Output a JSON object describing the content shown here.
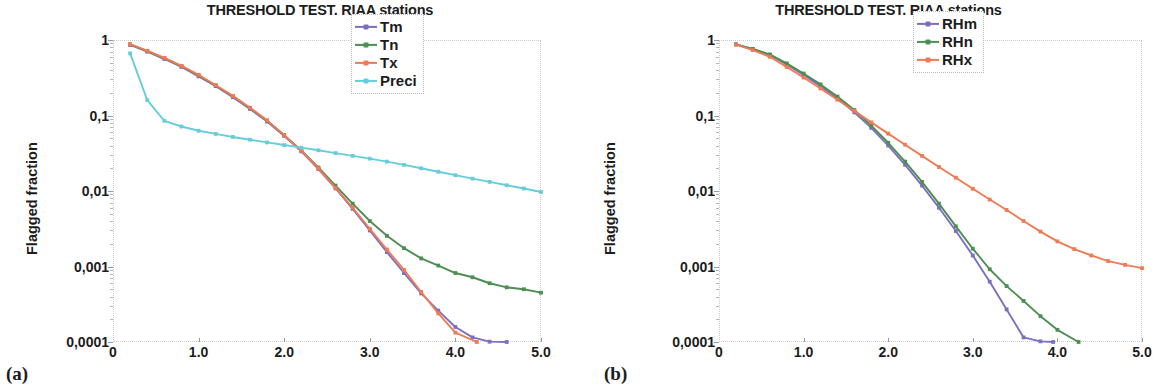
{
  "panels": [
    {
      "tag": "(a)",
      "title": "THRESHOLD TEST. RIAA stations",
      "xlabel": "Factor f",
      "ylabel": "Flagged fraction",
      "legend": [
        {
          "label": "Tm",
          "color": "#7d6fc0"
        },
        {
          "label": "Tn",
          "color": "#4d8f52"
        },
        {
          "label": "Tx",
          "color": "#ef7a55"
        },
        {
          "label": "Preci",
          "color": "#67cddb"
        }
      ]
    },
    {
      "tag": "(b)",
      "title": "THRESHOLD TEST. RIAA stations",
      "xlabel": "Factor f",
      "ylabel": "Flagged fraction",
      "legend": [
        {
          "label": "RHm",
          "color": "#7d6fc0"
        },
        {
          "label": "RHn",
          "color": "#4d8f52"
        },
        {
          "label": "RHx",
          "color": "#ef7a55"
        }
      ]
    }
  ],
  "axes": {
    "xticks": [
      "0",
      "1.0",
      "2.0",
      "3.0",
      "4.0",
      "5.0"
    ],
    "xtick_values": [
      0,
      1,
      2,
      3,
      4,
      5
    ],
    "yticks": [
      "1",
      "0,1",
      "0,01",
      "0,001",
      "0,0001"
    ],
    "ytick_values": [
      1,
      0.1,
      0.01,
      0.001,
      0.0001
    ]
  },
  "chart_data": [
    {
      "type": "line",
      "title": "THRESHOLD TEST. RIAA stations",
      "xlabel": "Factor f",
      "ylabel": "Flagged fraction",
      "yscale": "log",
      "xscale": "linear",
      "xlim": [
        0,
        5.0
      ],
      "ylim": [
        0.0001,
        1
      ],
      "grid": false,
      "legend_position": "top-right",
      "panel": "(a)",
      "series": [
        {
          "name": "Tm",
          "color": "#7d6fc0",
          "x": [
            0.2,
            0.4,
            0.6,
            0.8,
            1.0,
            1.2,
            1.4,
            1.6,
            1.8,
            2.0,
            2.2,
            2.4,
            2.6,
            2.8,
            3.0,
            3.2,
            3.4,
            3.6,
            3.8,
            4.0,
            4.2,
            4.4,
            4.6
          ],
          "y": [
            0.86,
            0.7,
            0.56,
            0.44,
            0.33,
            0.245,
            0.175,
            0.122,
            0.083,
            0.0535,
            0.0335,
            0.0195,
            0.0108,
            0.0058,
            0.003,
            0.00155,
            0.00082,
            0.00044,
            0.00026,
            0.000158,
            0.000115,
            0.000101,
            0.0001
          ]
        },
        {
          "name": "Tn",
          "color": "#4d8f52",
          "x": [
            0.2,
            0.4,
            0.6,
            0.8,
            1.0,
            1.2,
            1.4,
            1.6,
            1.8,
            2.0,
            2.2,
            2.4,
            2.6,
            2.8,
            3.0,
            3.2,
            3.4,
            3.6,
            3.8,
            4.0,
            4.2,
            4.4,
            4.6,
            4.8,
            5.0
          ],
          "y": [
            0.875,
            0.715,
            0.575,
            0.45,
            0.34,
            0.25,
            0.18,
            0.126,
            0.0855,
            0.055,
            0.0345,
            0.0205,
            0.0118,
            0.0068,
            0.004,
            0.00255,
            0.00175,
            0.00128,
            0.00103,
            0.00082,
            0.00072,
            0.0006,
            0.00053,
            0.0005,
            0.00045
          ]
        },
        {
          "name": "Tx",
          "color": "#ef7a55",
          "x": [
            0.2,
            0.4,
            0.6,
            0.8,
            1.0,
            1.2,
            1.4,
            1.6,
            1.8,
            2.0,
            2.2,
            2.4,
            2.6,
            2.8,
            3.0,
            3.2,
            3.4,
            3.6,
            3.8,
            4.0,
            4.25
          ],
          "y": [
            0.88,
            0.72,
            0.58,
            0.455,
            0.345,
            0.252,
            0.182,
            0.127,
            0.0862,
            0.0545,
            0.034,
            0.02,
            0.011,
            0.006,
            0.00315,
            0.00168,
            0.0009,
            0.00046,
            0.00024,
            0.000133,
            0.0001
          ]
        },
        {
          "name": "Preci",
          "color": "#67cddb",
          "x": [
            0.2,
            0.4,
            0.6,
            0.8,
            1.0,
            1.2,
            1.4,
            1.6,
            1.8,
            2.0,
            2.2,
            2.4,
            2.6,
            2.8,
            3.0,
            3.2,
            3.4,
            3.6,
            3.8,
            4.0,
            4.2,
            4.4,
            4.6,
            4.8,
            5.0
          ],
          "y": [
            0.665,
            0.16,
            0.085,
            0.0715,
            0.0628,
            0.057,
            0.052,
            0.0478,
            0.044,
            0.0406,
            0.0375,
            0.0346,
            0.0318,
            0.0292,
            0.0268,
            0.0245,
            0.0222,
            0.02,
            0.018,
            0.0162,
            0.0146,
            0.0132,
            0.0119,
            0.0108,
            0.0097
          ]
        }
      ]
    },
    {
      "type": "line",
      "title": "THRESHOLD TEST. RIAA stations",
      "xlabel": "Factor f",
      "ylabel": "Flagged fraction",
      "yscale": "log",
      "xscale": "linear",
      "xlim": [
        0,
        5.0
      ],
      "ylim": [
        0.0001,
        1
      ],
      "grid": false,
      "legend_position": "top-right",
      "panel": "(b)",
      "series": [
        {
          "name": "RHm",
          "color": "#7d6fc0",
          "x": [
            0.2,
            0.4,
            0.6,
            0.8,
            1.0,
            1.2,
            1.4,
            1.6,
            1.8,
            2.0,
            2.2,
            2.4,
            2.6,
            2.8,
            3.0,
            3.2,
            3.4,
            3.6,
            3.8,
            3.95
          ],
          "y": [
            0.875,
            0.755,
            0.635,
            0.475,
            0.345,
            0.245,
            0.168,
            0.11,
            0.0685,
            0.04,
            0.0222,
            0.0118,
            0.006,
            0.00295,
            0.0014,
            0.00063,
            0.00027,
            0.000115,
            0.000102,
            0.0001
          ]
        },
        {
          "name": "RHn",
          "color": "#4d8f52",
          "x": [
            0.2,
            0.4,
            0.6,
            0.8,
            1.0,
            1.2,
            1.4,
            1.6,
            1.8,
            2.0,
            2.2,
            2.4,
            2.6,
            2.8,
            3.0,
            3.2,
            3.4,
            3.6,
            3.8,
            4.0,
            4.25
          ],
          "y": [
            0.875,
            0.76,
            0.645,
            0.49,
            0.36,
            0.258,
            0.178,
            0.118,
            0.0735,
            0.0435,
            0.0245,
            0.0132,
            0.0068,
            0.0034,
            0.00172,
            0.00092,
            0.00055,
            0.00035,
            0.00022,
            0.000145,
            0.0001
          ]
        },
        {
          "name": "RHx",
          "color": "#ef7a55",
          "x": [
            0.2,
            0.4,
            0.6,
            0.8,
            1.0,
            1.2,
            1.4,
            1.6,
            1.8,
            2.0,
            2.2,
            2.4,
            2.6,
            2.8,
            3.0,
            3.2,
            3.4,
            3.6,
            3.8,
            4.0,
            4.2,
            4.4,
            4.6,
            4.8,
            5.0
          ],
          "y": [
            0.87,
            0.735,
            0.6,
            0.44,
            0.318,
            0.228,
            0.162,
            0.115,
            0.081,
            0.0575,
            0.041,
            0.0292,
            0.0208,
            0.015,
            0.0107,
            0.0077,
            0.0056,
            0.004,
            0.0029,
            0.00215,
            0.0017,
            0.0014,
            0.00118,
            0.00105,
            0.00095
          ]
        }
      ]
    }
  ]
}
